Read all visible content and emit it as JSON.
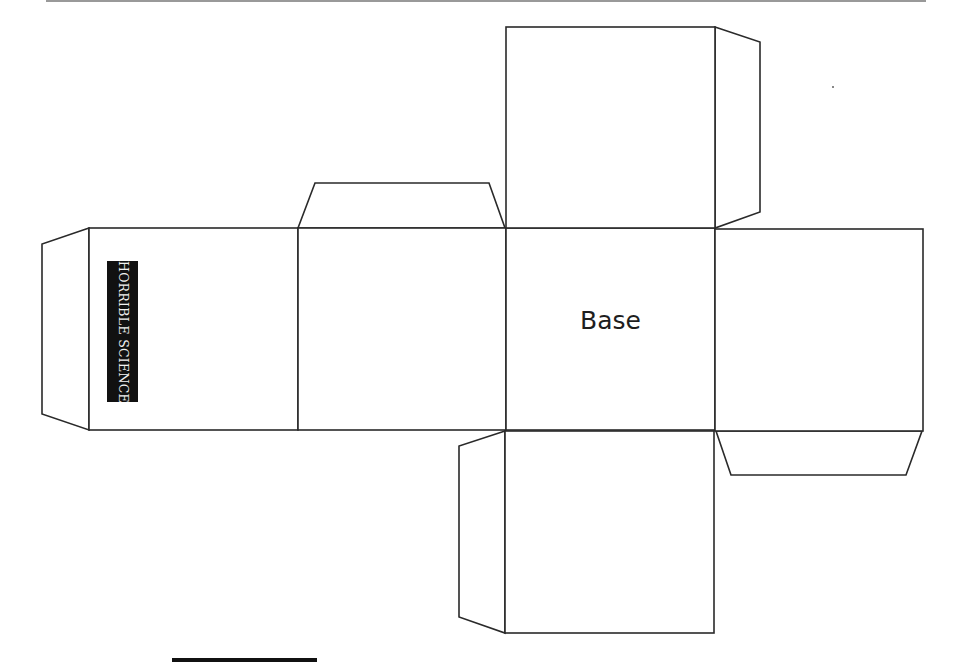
{
  "diagram": {
    "type": "cube-net",
    "logo_text": "HORRIBLE SCIENCE",
    "base_label": "Base",
    "colors": {
      "line": "#2a2a2a",
      "logo_bg": "#111111",
      "logo_text": "#f2f2f2",
      "background": "#ffffff"
    },
    "faces": [
      {
        "name": "left-face",
        "has_logo": true
      },
      {
        "name": "middle-left-face"
      },
      {
        "name": "base-face",
        "label": "Base"
      },
      {
        "name": "right-face"
      },
      {
        "name": "top-face"
      },
      {
        "name": "bottom-face"
      }
    ],
    "tabs": [
      "left-tab",
      "top-tab",
      "top-face-right-tab",
      "right-face-bottom-tab",
      "bottom-face-left-tab"
    ]
  }
}
